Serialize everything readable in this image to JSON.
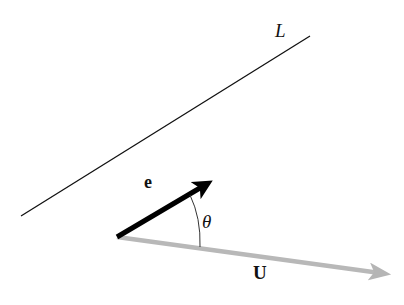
{
  "diagram": {
    "title": "",
    "line": {
      "label": "L",
      "color": "#111111"
    },
    "unit_vector": {
      "label": "e",
      "color": "#000000"
    },
    "vector": {
      "label": "U",
      "color": "#b8b8b8"
    },
    "angle": {
      "label": "θ",
      "color": "#333333"
    },
    "background": "#ffffff"
  }
}
